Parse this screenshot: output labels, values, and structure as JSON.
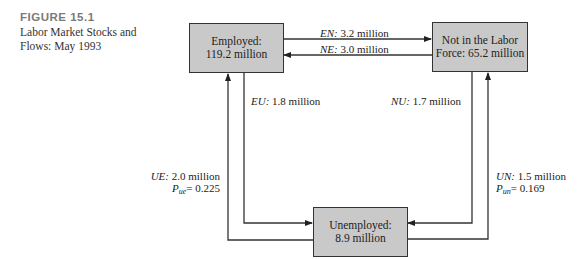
{
  "figure": {
    "number": "FIGURE 15.1",
    "title_line1": "Labor Market Stocks and",
    "title_line2": "Flows: May 1993"
  },
  "nodes": {
    "employed": {
      "line1": "Employed:",
      "line2": "119.2 million"
    },
    "not_in_labor_force": {
      "line1": "Not in the Labor",
      "line2": "Force: 65.2 million"
    },
    "unemployed": {
      "line1": "Unemployed:",
      "line2": "8.9 million"
    }
  },
  "flows": {
    "EN": {
      "code": "EN:",
      "value": "3.2 million"
    },
    "NE": {
      "code": "NE:",
      "value": "3.0 million"
    },
    "EU": {
      "code": "EU:",
      "value": "1.8 million"
    },
    "NU": {
      "code": "NU:",
      "value": "1.7 million"
    },
    "UE": {
      "code": "UE:",
      "value": "2.0 million",
      "prob_symbol": "P",
      "prob_sub": "ue",
      "prob_value": "= 0.225"
    },
    "UN": {
      "code": "UN:",
      "value": "1.5 million",
      "prob_symbol": "P",
      "prob_sub": "un",
      "prob_value": "= 0.169"
    }
  },
  "colors": {
    "box_fill": "#c9c9c9",
    "line": "#333333",
    "figure_number": "#7a7a7a"
  }
}
